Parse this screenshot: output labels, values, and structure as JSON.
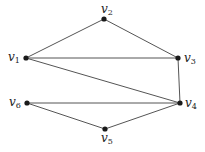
{
  "graph": {
    "nodes": [
      {
        "id": "v1",
        "base": "v",
        "sub": "1",
        "x": 26,
        "y": 58,
        "label_x": 8,
        "label_y": 51
      },
      {
        "id": "v2",
        "base": "v",
        "sub": "2",
        "x": 104,
        "y": 19,
        "label_x": 101,
        "label_y": 3
      },
      {
        "id": "v3",
        "base": "v",
        "sub": "3",
        "x": 178,
        "y": 58,
        "label_x": 184,
        "label_y": 52
      },
      {
        "id": "v4",
        "base": "v",
        "sub": "4",
        "x": 180,
        "y": 103,
        "label_x": 185,
        "label_y": 97
      },
      {
        "id": "v5",
        "base": "v",
        "sub": "5",
        "x": 105,
        "y": 129,
        "label_x": 101,
        "label_y": 132
      },
      {
        "id": "v6",
        "base": "v",
        "sub": "6",
        "x": 27,
        "y": 103,
        "label_x": 9,
        "label_y": 96
      }
    ],
    "edges": [
      [
        "v1",
        "v2"
      ],
      [
        "v2",
        "v3"
      ],
      [
        "v1",
        "v3"
      ],
      [
        "v1",
        "v4"
      ],
      [
        "v3",
        "v4"
      ],
      [
        "v6",
        "v4"
      ],
      [
        "v6",
        "v5"
      ],
      [
        "v5",
        "v4"
      ]
    ],
    "colors": {
      "edge": "#555555",
      "node": "#1a1a1a",
      "label": "#222222"
    }
  }
}
